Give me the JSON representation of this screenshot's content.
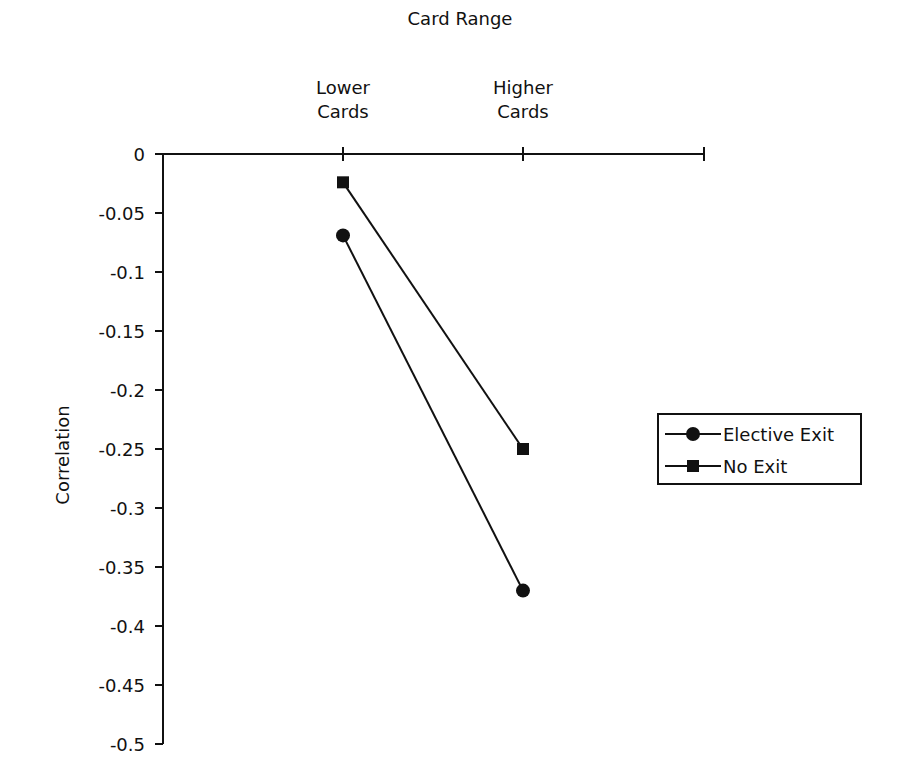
{
  "chart_data": {
    "type": "line",
    "title": "Card Range",
    "xlabel": "Card Range",
    "ylabel": "Correlation",
    "categories": [
      "Lower Cards",
      "Higher Cards"
    ],
    "category_lines": [
      [
        "Lower",
        "Cards"
      ],
      [
        "Higher",
        "Cards"
      ]
    ],
    "series": [
      {
        "name": "Elective Exit",
        "marker": "circle",
        "values": [
          -0.069,
          -0.37
        ]
      },
      {
        "name": "No Exit",
        "marker": "square",
        "values": [
          -0.024,
          -0.25
        ]
      }
    ],
    "ylim": [
      -0.5,
      0
    ],
    "yticks": [
      0,
      -0.05,
      -0.1,
      -0.15,
      -0.2,
      -0.25,
      -0.3,
      -0.35,
      -0.4,
      -0.45,
      -0.5
    ],
    "ytick_labels": [
      "0",
      "-0.05",
      "-0.1",
      "-0.15",
      "-0.2",
      "-0.25",
      "-0.3",
      "-0.35",
      "-0.4",
      "-0.45",
      "-0.5"
    ],
    "x_axis_position": "top",
    "grid": false,
    "legend_position": "right"
  },
  "labels": {
    "x_title": "Card Range",
    "y_title": "Correlation",
    "cat0_line1": "Lower",
    "cat0_line2": "Cards",
    "cat1_line1": "Higher",
    "cat1_line2": "Cards",
    "legend_0": "Elective Exit",
    "legend_1": "No Exit"
  }
}
